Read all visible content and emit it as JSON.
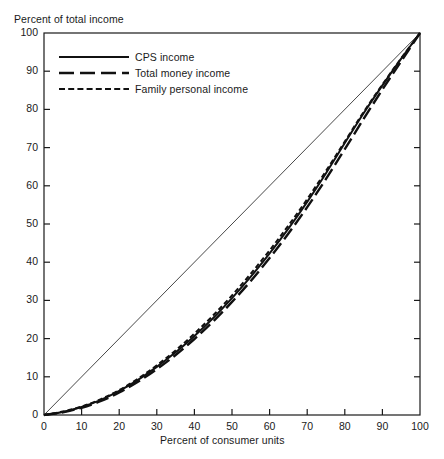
{
  "chart_data": {
    "type": "line",
    "title": "",
    "xlabel": "Percent of consumer units",
    "ylabel": "Percent of total income",
    "xlim": [
      0,
      100
    ],
    "ylim": [
      0,
      100
    ],
    "grid": false,
    "legend_position": "top-left-inside",
    "xticks": [
      0,
      10,
      20,
      30,
      40,
      50,
      60,
      70,
      80,
      90,
      100
    ],
    "yticks": [
      0,
      10,
      20,
      30,
      40,
      50,
      60,
      70,
      80,
      90,
      100
    ],
    "xtick_labels": [
      "0",
      "10",
      "20",
      "30",
      "40",
      "50",
      "60",
      "70",
      "80",
      "90",
      "100"
    ],
    "ytick_labels": [
      "0",
      "10",
      "20",
      "30",
      "40",
      "50",
      "60",
      "70",
      "80",
      "90",
      "100"
    ],
    "reference_line": {
      "name": "line-of-equality",
      "x": [
        0,
        100
      ],
      "y": [
        0,
        100
      ],
      "style": "solid-thin"
    },
    "x": [
      0,
      5,
      10,
      15,
      20,
      25,
      30,
      35,
      40,
      45,
      50,
      55,
      60,
      65,
      70,
      75,
      80,
      85,
      90,
      95,
      100
    ],
    "series": [
      {
        "name": "CPS income",
        "style": "solid",
        "values": [
          0,
          0.8,
          2.1,
          3.9,
          6.3,
          9.2,
          12.6,
          16.4,
          20.7,
          25.4,
          30.6,
          36.2,
          42.3,
          48.8,
          55.8,
          63.3,
          71.2,
          79.0,
          86.3,
          93.3,
          100
        ]
      },
      {
        "name": "Total money income",
        "style": "long-dash",
        "values": [
          0,
          0.7,
          1.9,
          3.6,
          5.9,
          8.7,
          12.0,
          15.7,
          19.9,
          24.5,
          29.6,
          35.1,
          41.1,
          47.5,
          54.4,
          61.8,
          69.6,
          77.5,
          85.2,
          92.6,
          100
        ]
      },
      {
        "name": "Family personal income",
        "style": "short-dash",
        "values": [
          0,
          0.9,
          2.2,
          4.1,
          6.5,
          9.5,
          13.0,
          16.9,
          21.3,
          26.1,
          31.3,
          37.0,
          43.1,
          49.6,
          56.5,
          63.9,
          71.6,
          79.3,
          86.5,
          93.4,
          100
        ]
      }
    ]
  },
  "legend": {
    "items": [
      {
        "label": "CPS income",
        "style": "solid"
      },
      {
        "label": "Total money income",
        "style": "long-dash"
      },
      {
        "label": "Family personal income",
        "style": "short-dash"
      }
    ]
  },
  "axes": {
    "y_axis_title": "Percent of total income",
    "x_axis_title": "Percent of consumer units"
  }
}
